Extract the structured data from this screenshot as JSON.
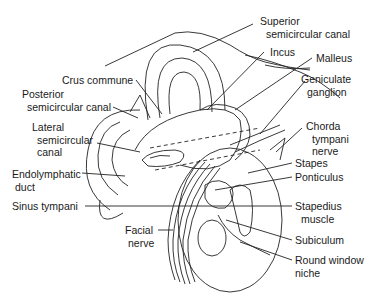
{
  "figure": {
    "labels": {
      "superior_semicircular_canal": [
        "Superior",
        "semicircular canal"
      ],
      "incus": [
        "Incus"
      ],
      "malleus": [
        "Malleus"
      ],
      "geniculate_ganglion": [
        "Geniculate",
        "ganglion"
      ],
      "crus_commune": [
        "Crus commune"
      ],
      "posterior_semicircular_canal": [
        "Posterior",
        "semicircular canal"
      ],
      "lateral_semicircular_canal": [
        "Lateral",
        "semicircular",
        "canal"
      ],
      "chorda_tympani_nerve": [
        "Chorda",
        "tympani",
        "nerve"
      ],
      "stapes": [
        "Stapes"
      ],
      "ponticulus": [
        "Ponticulus"
      ],
      "endolymphatic_duct": [
        "Endolymphatic",
        "duct"
      ],
      "sinus_tympani": [
        "Sinus tympani"
      ],
      "stapedius_muscle": [
        "Stapedius",
        "muscle"
      ],
      "facial_nerve": [
        "Facial",
        "nerve"
      ],
      "subiculum": [
        "Subiculum"
      ],
      "round_window_niche": [
        "Round window",
        "niche"
      ]
    }
  }
}
